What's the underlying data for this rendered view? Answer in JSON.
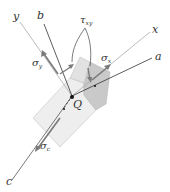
{
  "diagram": {
    "type": "stress-element-3d",
    "labels": {
      "axis_y": "y",
      "axis_b": "b",
      "axis_x": "x",
      "axis_a": "a",
      "axis_c": "c",
      "point": "Q",
      "sigma_y": {
        "base": "σ",
        "sub": "y"
      },
      "sigma_x": {
        "base": "σ",
        "sub": "x"
      },
      "sigma_c": {
        "base": "σ",
        "sub": "c"
      },
      "tau_xy": {
        "base": "τ",
        "sub": "xy"
      }
    },
    "colors": {
      "axis_line_light": "#aaaaaa",
      "axis_line_dark": "#333333",
      "arrow": "#7a7a7a",
      "cube_top": "#e6e6e6",
      "cube_front": "#eeeeee",
      "cube_side": "#c8c8c8",
      "text": "#333333"
    }
  }
}
